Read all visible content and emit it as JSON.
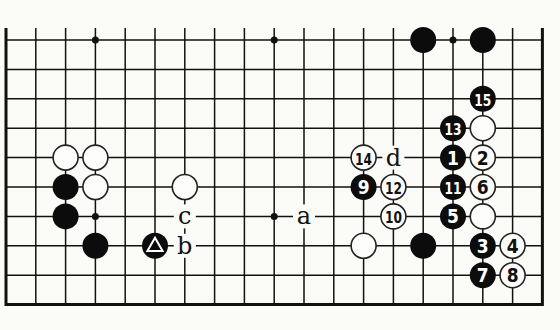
{
  "diagram": {
    "type": "go-board-diagram",
    "view": "bottom portion of 19x19 board (bottom 10 lines shown)",
    "columns": 19,
    "rows_shown": 10,
    "edges": {
      "left": true,
      "right": true,
      "bottom": true,
      "top": false
    },
    "hoshi": [
      [
        3,
        0
      ],
      [
        9,
        0
      ],
      [
        15,
        0
      ],
      [
        3,
        6
      ],
      [
        9,
        6
      ]
    ],
    "stones": [
      {
        "color": "white",
        "col": 2,
        "row": 4,
        "label": ""
      },
      {
        "color": "white",
        "col": 3,
        "row": 4,
        "label": ""
      },
      {
        "color": "white",
        "col": 3,
        "row": 5,
        "label": ""
      },
      {
        "color": "white",
        "col": 6,
        "row": 5,
        "label": ""
      },
      {
        "color": "black",
        "col": 2,
        "row": 5,
        "label": ""
      },
      {
        "color": "black",
        "col": 2,
        "row": 6,
        "label": ""
      },
      {
        "color": "black",
        "col": 3,
        "row": 7,
        "label": ""
      },
      {
        "color": "black",
        "col": 5,
        "row": 7,
        "label": "triangle"
      },
      {
        "color": "black",
        "col": 14,
        "row": 0,
        "label": ""
      },
      {
        "color": "black",
        "col": 16,
        "row": 0,
        "label": ""
      },
      {
        "color": "black",
        "col": 16,
        "row": 2,
        "label": "15"
      },
      {
        "color": "black",
        "col": 15,
        "row": 3,
        "label": "13"
      },
      {
        "color": "white",
        "col": 16,
        "row": 3,
        "label": ""
      },
      {
        "color": "white",
        "col": 12,
        "row": 4,
        "label": "14"
      },
      {
        "color": "black",
        "col": 15,
        "row": 4,
        "label": "1"
      },
      {
        "color": "white",
        "col": 16,
        "row": 4,
        "label": "2"
      },
      {
        "color": "black",
        "col": 12,
        "row": 5,
        "label": "9"
      },
      {
        "color": "white",
        "col": 13,
        "row": 5,
        "label": "12"
      },
      {
        "color": "black",
        "col": 15,
        "row": 5,
        "label": "11"
      },
      {
        "color": "white",
        "col": 16,
        "row": 5,
        "label": "6"
      },
      {
        "color": "white",
        "col": 13,
        "row": 6,
        "label": "10"
      },
      {
        "color": "black",
        "col": 15,
        "row": 6,
        "label": "5"
      },
      {
        "color": "white",
        "col": 16,
        "row": 6,
        "label": ""
      },
      {
        "color": "white",
        "col": 12,
        "row": 7,
        "label": ""
      },
      {
        "color": "black",
        "col": 14,
        "row": 7,
        "label": ""
      },
      {
        "color": "black",
        "col": 16,
        "row": 7,
        "label": "3"
      },
      {
        "color": "white",
        "col": 17,
        "row": 7,
        "label": "4"
      },
      {
        "color": "black",
        "col": 16,
        "row": 8,
        "label": "7"
      },
      {
        "color": "white",
        "col": 17,
        "row": 8,
        "label": "8"
      }
    ],
    "letters": [
      {
        "text": "d",
        "col": 13,
        "row": 4
      },
      {
        "text": "a",
        "col": 10,
        "row": 6
      },
      {
        "text": "c",
        "col": 6,
        "row": 6
      },
      {
        "text": "b",
        "col": 6,
        "row": 7
      }
    ]
  }
}
